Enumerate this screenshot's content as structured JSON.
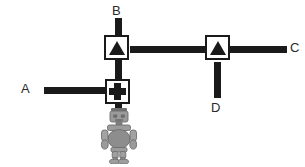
{
  "diagram": {
    "background_color": "#ffffff",
    "line_color": "#1a1a1a",
    "robot_color": "#8c8c8c",
    "endpoints": [
      {
        "id": "A",
        "label": "A",
        "position": "left"
      },
      {
        "id": "B",
        "label": "B",
        "position": "top"
      },
      {
        "id": "C",
        "label": "C",
        "position": "right"
      },
      {
        "id": "D",
        "label": "D",
        "position": "bottom-right"
      }
    ],
    "valves": [
      {
        "id": "valve-ab",
        "glyph": "triangle-up-icon",
        "connects": [
          "B",
          "A",
          "C"
        ]
      },
      {
        "id": "valve-cd",
        "glyph": "triangle-up-icon",
        "connects": [
          "C",
          "D"
        ]
      },
      {
        "id": "valve-a",
        "glyph": "plus-icon",
        "connects": [
          "A",
          "robot"
        ]
      }
    ],
    "robot": {
      "name": "robot-figure",
      "description": "small gray toy robot at the bottom of the vertical pipe"
    }
  }
}
